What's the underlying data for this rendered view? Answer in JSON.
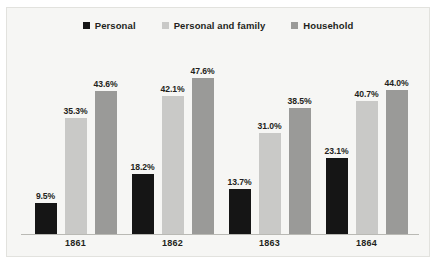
{
  "chart_data": {
    "type": "bar",
    "title": "",
    "subtitle": "",
    "xlabel": "",
    "ylabel": "",
    "categories": [
      "1861",
      "1862",
      "1863",
      "1864"
    ],
    "ylim": [
      0,
      55
    ],
    "grid": false,
    "legend_position": "top-center",
    "value_suffix": "%",
    "series": [
      {
        "name": "Personal",
        "color": "#151515",
        "values": [
          9.5,
          18.2,
          13.7,
          23.1
        ],
        "labels": [
          "9.5%",
          "18.2%",
          "13.7%",
          "23.1%"
        ]
      },
      {
        "name": "Personal and family",
        "color": "#c9c9c7",
        "values": [
          35.3,
          42.1,
          31.0,
          40.7
        ],
        "labels": [
          "35.3%",
          "42.1%",
          "31.0%",
          "40.7%"
        ]
      },
      {
        "name": "Household",
        "color": "#9a9a98",
        "values": [
          43.6,
          47.6,
          38.5,
          44.0
        ],
        "labels": [
          "43.6%",
          "47.6%",
          "38.5%",
          "44.0%"
        ]
      }
    ]
  },
  "colors": {
    "background": "#f6f6f4",
    "border": "#e2e2de",
    "axis": "#b9b9b4",
    "text": "#231f20"
  }
}
